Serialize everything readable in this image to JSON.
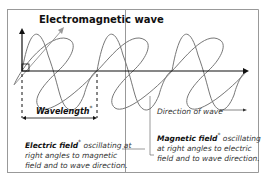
{
  "diagram": {
    "title": "Electromagnetic wave",
    "wavelength_label": "Wavelength",
    "asterisk": "*",
    "direction_label": "Direction of wave",
    "electric": {
      "term": "Electric field",
      "description": "oscillating at right angles to magnetic field and to wave direction."
    },
    "magnetic": {
      "term": "Magnetic field",
      "description": "oscillating at right angles to electric field and to wave direction."
    },
    "colors": {
      "wave": "#777777",
      "axis": "#111111",
      "frame": "#888888"
    }
  }
}
